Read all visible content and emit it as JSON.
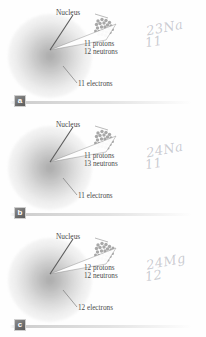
{
  "figure": {
    "panel_count": 3,
    "background_color": "#fefefe",
    "ink_color": "#4a4a4a",
    "handwriting_color": "#7d8290",
    "cloud_color": "#8a8a8a"
  },
  "labels": {
    "nucleus": "Nucleus"
  },
  "panels": [
    {
      "marker": "a",
      "nucleus_label": "Nucleus",
      "protons_line": "11 protons",
      "neutrons_line": "12 neutrons",
      "electrons_line": "11 electrons",
      "protons": 11,
      "neutrons": 12,
      "electrons": 11,
      "annotation_mass": "23",
      "annotation_symbol": "Na",
      "annotation_atomic_number": "11"
    },
    {
      "marker": "b",
      "nucleus_label": "Nucleus",
      "protons_line": "11 protons",
      "neutrons_line": "13 neutrons",
      "electrons_line": "11 electrons",
      "protons": 11,
      "neutrons": 13,
      "electrons": 11,
      "annotation_mass": "24",
      "annotation_symbol": "Na",
      "annotation_atomic_number": "11"
    },
    {
      "marker": "c",
      "nucleus_label": "Nucleus",
      "protons_line": "12 protons",
      "neutrons_line": "12 neutrons",
      "electrons_line": "12 electrons",
      "protons": 12,
      "neutrons": 12,
      "electrons": 12,
      "annotation_mass": "24",
      "annotation_symbol": "Mg",
      "annotation_atomic_number": "12"
    }
  ]
}
